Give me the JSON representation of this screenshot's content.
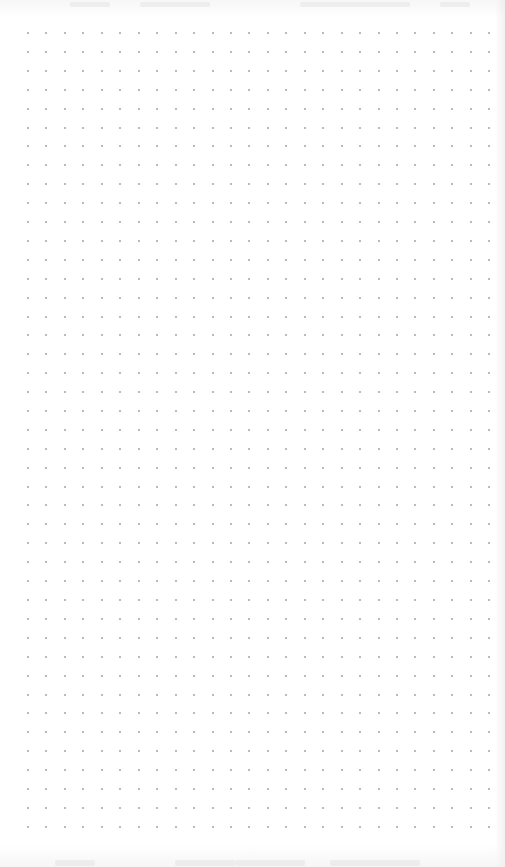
{
  "canvas": {
    "type": "dot-grid-page",
    "background": "#ffffff",
    "dot_color": "#a3a3a3",
    "columns": 26,
    "rows": 43,
    "spacing_x": 18.45,
    "spacing_y": 18.9,
    "origin_x": 27,
    "origin_y": 32
  }
}
